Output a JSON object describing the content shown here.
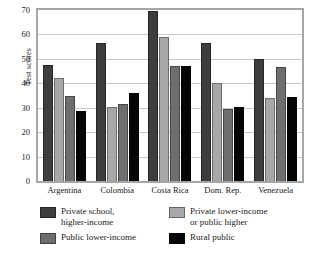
{
  "chart_data": {
    "type": "bar",
    "title": "",
    "xlabel": "",
    "ylabel": "Test scores",
    "ylim": [
      0,
      70
    ],
    "yticks": [
      0,
      10,
      20,
      30,
      40,
      50,
      60,
      70
    ],
    "grid": true,
    "legend_position": "bottom",
    "categories": [
      "Argentina",
      "Colombia",
      "Costa Rica",
      "Dom. Rep.",
      "Venezuela"
    ],
    "series": [
      {
        "name": "Private school, higher-income",
        "color": "#3d3d3d",
        "values": [
          47.5,
          56.5,
          69.5,
          56.5,
          50.0
        ]
      },
      {
        "name": "Private lower-income or public higher",
        "color": "#a8a8a8",
        "values": [
          42.0,
          30.5,
          59.0,
          40.0,
          34.0
        ]
      },
      {
        "name": "Public lower-income",
        "color": "#6e6e6e",
        "values": [
          35.0,
          31.5,
          47.0,
          29.5,
          46.5
        ]
      },
      {
        "name": "Rural public",
        "color": "#050505",
        "values": [
          28.5,
          36.0,
          47.0,
          30.5,
          34.5
        ]
      }
    ]
  },
  "legend": {
    "items": [
      {
        "label": "Private school,\nhigher-income",
        "color": "#3d3d3d"
      },
      {
        "label": "Private lower-income\nor public higher",
        "color": "#a8a8a8"
      },
      {
        "label": "Public lower-income",
        "color": "#6e6e6e"
      },
      {
        "label": "Rural public",
        "color": "#050505"
      }
    ]
  },
  "axis": {
    "y_title": "Test scores",
    "y_tick_labels": [
      "70",
      "60",
      "50",
      "40",
      "30",
      "20",
      "10",
      "0"
    ]
  }
}
